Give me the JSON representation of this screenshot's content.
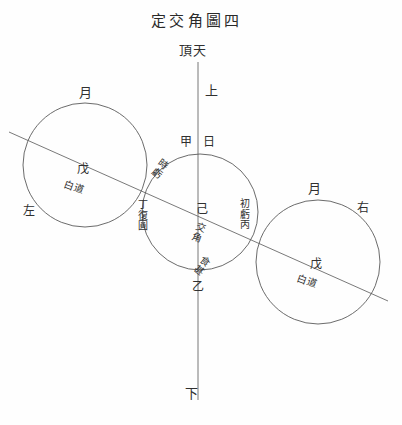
{
  "figure": {
    "title": "定交角圖四",
    "zenith": "頂天",
    "up": "上",
    "down": "下",
    "left": "左",
    "right": "右"
  },
  "sun": {
    "name": "日",
    "top_point": "甲",
    "bottom_point": "乙",
    "center_point": "己",
    "center_note": "交角",
    "upper_left_arc": "時虧",
    "lower_right_arc": "食甚"
  },
  "moon_left": {
    "name": "月",
    "point": "戊",
    "path": "白道"
  },
  "moon_right": {
    "name": "月",
    "point": "戊",
    "path": "白道"
  },
  "contacts": {
    "first_contact": "初虧丙",
    "last_contact": "丁復圓"
  },
  "colors": {
    "ink": "#303030",
    "line": "#555555",
    "paper": "#fefefe"
  }
}
